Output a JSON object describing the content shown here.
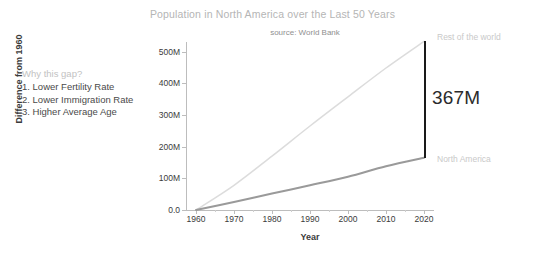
{
  "chart_data": {
    "type": "line",
    "title": "Population in North America over the Last 50 Years",
    "subtitle": "source: World Bank",
    "xlabel": "Year",
    "ylabel": "Difference from 1960",
    "xlim": [
      1958,
      2022
    ],
    "ylim": [
      0,
      530
    ],
    "grid": false,
    "legend_position": "right-of-line-ends",
    "x": [
      1960,
      1970,
      1980,
      1990,
      2000,
      2010,
      2020
    ],
    "xtick_labels": [
      "1960",
      "1970",
      "1980",
      "1990",
      "2000",
      "2010",
      "2020"
    ],
    "ytick_labels": [
      "0.0",
      "100M",
      "200M",
      "300M",
      "400M",
      "500M"
    ],
    "ytick_values": [
      0,
      100,
      200,
      300,
      400,
      500
    ],
    "units": "millions of people",
    "series": [
      {
        "name": "Rest of the world",
        "color": "#dcdcdc",
        "values": [
          0,
          78,
          170,
          265,
          357,
          448,
          532
        ]
      },
      {
        "name": "North America",
        "color": "#9a9a9a",
        "values": [
          0,
          25,
          52,
          78,
          105,
          138,
          165
        ]
      }
    ],
    "annotations": [
      {
        "name": "gap-bracket",
        "label": "367M",
        "at_x": 2020,
        "from_y": 165,
        "to_y": 532,
        "color": "#1a1a1a"
      }
    ]
  },
  "annotation_block": {
    "heading": "Why this gap?",
    "items": [
      "1. Lower Fertility Rate",
      "2. Lower Immigration Rate",
      "3. Higher Average Age"
    ]
  }
}
